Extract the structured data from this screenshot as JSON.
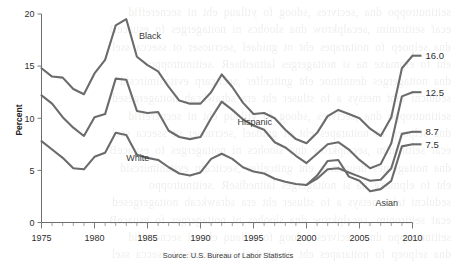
{
  "chart_data": {
    "type": "line",
    "title": "",
    "xlabel": "",
    "ylabel": "Percent",
    "source": "Source: U.S. Bureau of Labor Statistics",
    "xlim": [
      1975,
      2010
    ],
    "ylim": [
      0,
      20
    ],
    "yticks": [
      0,
      5,
      10,
      15,
      20
    ],
    "xticks": [
      1975,
      1980,
      1985,
      1990,
      1995,
      2000,
      2005,
      2010
    ],
    "xtick_labels": [
      "1975",
      "1980",
      "1985",
      "1990",
      "1995",
      "2000",
      "2005",
      "2010"
    ],
    "ytick_labels": [
      "0",
      "5",
      "10",
      "15",
      "20"
    ],
    "minor_ticks": "every year",
    "grid": false,
    "legend": "inline series labels",
    "line_color": "#6b6b6b",
    "series": [
      {
        "name": "Black",
        "label": "Black",
        "end_value_label": "16.0",
        "x": [
          1975,
          1976,
          1977,
          1978,
          1979,
          1980,
          1981,
          1982,
          1983,
          1984,
          1985,
          1986,
          1987,
          1988,
          1989,
          1990,
          1991,
          1992,
          1993,
          1994,
          1995,
          1996,
          1997,
          1998,
          1999,
          2000,
          2001,
          2002,
          2003,
          2004,
          2005,
          2006,
          2007,
          2008,
          2009,
          2010
        ],
        "values": [
          14.8,
          14.0,
          13.9,
          12.8,
          12.3,
          14.3,
          15.6,
          18.9,
          19.5,
          15.9,
          15.1,
          14.5,
          13.0,
          11.7,
          11.4,
          11.4,
          12.5,
          14.2,
          13.0,
          11.5,
          10.4,
          10.5,
          10.0,
          8.9,
          8.0,
          7.6,
          8.6,
          10.2,
          10.8,
          10.4,
          10.0,
          9.0,
          8.3,
          10.1,
          14.8,
          16.0
        ]
      },
      {
        "name": "Hispanic",
        "label": "Hispanic",
        "end_value_label": "12.5",
        "x": [
          1975,
          1976,
          1977,
          1978,
          1979,
          1980,
          1981,
          1982,
          1983,
          1984,
          1985,
          1986,
          1987,
          1988,
          1989,
          1990,
          1991,
          1992,
          1993,
          1994,
          1995,
          1996,
          1997,
          1998,
          1999,
          2000,
          2001,
          2002,
          2003,
          2004,
          2005,
          2006,
          2007,
          2008,
          2009,
          2010
        ],
        "values": [
          12.2,
          11.4,
          10.1,
          9.1,
          8.3,
          10.1,
          10.4,
          13.8,
          13.7,
          10.7,
          10.5,
          10.6,
          8.8,
          8.2,
          8.0,
          8.2,
          10.0,
          11.6,
          10.8,
          9.9,
          9.3,
          8.9,
          7.7,
          7.2,
          6.4,
          5.7,
          6.6,
          7.5,
          7.7,
          7.0,
          6.0,
          5.2,
          5.6,
          7.6,
          12.1,
          12.5
        ]
      },
      {
        "name": "White",
        "label": "White",
        "end_value_label": "8.7",
        "x": [
          1975,
          1976,
          1977,
          1978,
          1979,
          1980,
          1981,
          1982,
          1983,
          1984,
          1985,
          1986,
          1987,
          1988,
          1989,
          1990,
          1991,
          1992,
          1993,
          1994,
          1995,
          1996,
          1997,
          1998,
          1999,
          2000,
          2001,
          2002,
          2003,
          2004,
          2005,
          2006,
          2007,
          2008,
          2009,
          2010
        ],
        "values": [
          7.8,
          7.0,
          6.2,
          5.2,
          5.1,
          6.3,
          6.7,
          8.6,
          8.4,
          6.5,
          6.2,
          6.0,
          5.3,
          4.7,
          4.5,
          4.8,
          6.1,
          6.6,
          6.1,
          5.3,
          4.9,
          4.7,
          4.2,
          3.9,
          3.7,
          3.6,
          4.2,
          5.1,
          5.2,
          4.8,
          4.4,
          4.0,
          4.1,
          5.2,
          8.5,
          8.7
        ]
      },
      {
        "name": "Asian",
        "label": "Asian",
        "end_value_label": "7.5",
        "x": [
          2000,
          2001,
          2002,
          2003,
          2004,
          2005,
          2006,
          2007,
          2008,
          2009,
          2010
        ],
        "values": [
          3.6,
          4.5,
          5.9,
          6.0,
          4.4,
          4.0,
          3.0,
          3.2,
          4.0,
          7.3,
          7.5
        ]
      }
    ],
    "annotations": [
      {
        "text": "Black",
        "x": 1984.2,
        "y": 17.6
      },
      {
        "text": "Hispanic",
        "x": 1993.5,
        "y": 9.4
      },
      {
        "text": "White",
        "x": 1983.0,
        "y": 5.9
      },
      {
        "text": "Asian",
        "x": 2006.5,
        "y": 1.55
      }
    ],
    "end_labels": [
      {
        "text": "16.0",
        "series": "Black"
      },
      {
        "text": "12.5",
        "series": "Hispanic"
      },
      {
        "text": "8.7",
        "series": "White"
      },
      {
        "text": "7.5",
        "series": "Asian"
      }
    ]
  },
  "background_text": {
    "note": "faint show-through text from reverse of scanned page",
    "lines": [
      "seitinutroppo dna ,secivres ,sdoog fo ytilauq eht ni secnereffid",
      "ecaf seitironim ,secalpkrow dna sloohcs ni noitagerges fo esuaceB",
      "dna selpoep fo noitarapes eht ot gnidael ,secruoser ot ssecca ssel",
      "eht fo elpmaxe na si noitagerges laitnediseR .seitinutroppo",
      "dna noitagerges deunitnoc eht gnitcelfer ,secitcarp evitanimircsid",
      "sedulcni taht metsys a fo stluser eht era sdrawkcab noitagergesed"
    ]
  }
}
